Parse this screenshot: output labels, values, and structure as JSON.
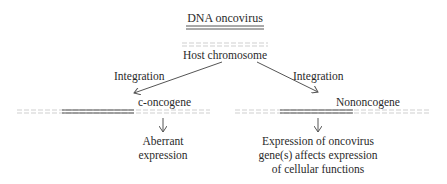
{
  "title": "DNA oncovirus",
  "host": {
    "label": "Host chromosome"
  },
  "left_branch": {
    "arrow_label": "Integration",
    "gene_label": "c-oncogene",
    "outcome_lines": [
      "Aberrant",
      "expression"
    ]
  },
  "right_branch": {
    "arrow_label": "Integration",
    "gene_label": "Nononcogene",
    "outcome_lines": [
      "Expression of oncovirus",
      "gene(s) affects expression",
      "of cellular functions"
    ]
  },
  "colors": {
    "text": "#2a2a2a",
    "dashed_line": "#c8c8c8",
    "solid_line": "#555555",
    "arrow": "#555555"
  }
}
